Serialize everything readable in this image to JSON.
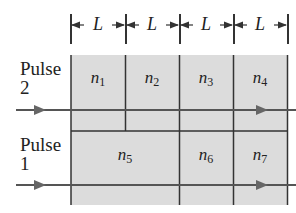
{
  "diagram": {
    "length_label": "L",
    "segments": [
      "L",
      "L",
      "L",
      "L"
    ],
    "pulses": [
      {
        "label_line1": "Pulse",
        "label_line2": "2",
        "cells": [
          {
            "name": "n",
            "sub": "1"
          },
          {
            "name": "n",
            "sub": "2"
          },
          {
            "name": "n",
            "sub": "3"
          },
          {
            "name": "n",
            "sub": "4"
          }
        ]
      },
      {
        "label_line1": "Pulse",
        "label_line2": "1",
        "cells": [
          {
            "name": "n",
            "sub": "5"
          },
          {
            "name": "n",
            "sub": "6"
          },
          {
            "name": "n",
            "sub": "7"
          }
        ]
      }
    ],
    "colors": {
      "fill": "#dcdcdc",
      "line": "#333333",
      "arrow": "#666666"
    }
  }
}
